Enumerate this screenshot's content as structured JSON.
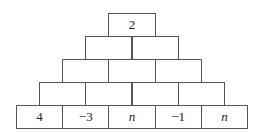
{
  "pyramid": {
    "rows": [
      [
        "2"
      ],
      [
        "",
        ""
      ],
      [
        "",
        "",
        ""
      ],
      [
        "",
        "",
        "",
        ""
      ],
      [
        "4",
        "−3",
        "n",
        "−1",
        "n"
      ]
    ]
  }
}
